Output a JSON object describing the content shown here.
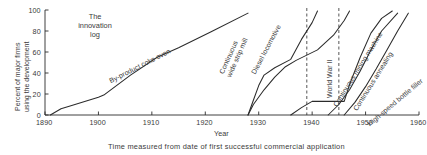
{
  "chart_data": {
    "type": "line",
    "title": "The innovation log",
    "xlabel": "Year",
    "ylabel": "Percent of major firms using the development",
    "caption": "Time measured from date of first successful commercial application",
    "xlim": [
      1890,
      1960
    ],
    "ylim": [
      0,
      100
    ],
    "grid": false,
    "legend": "none (curves labeled inline)",
    "xticks": [
      "1890",
      "1900",
      "1910",
      "1920",
      "1930",
      "1940",
      "1950",
      "1960"
    ],
    "yticks": [
      "0",
      "20",
      "40",
      "60",
      "80",
      "100"
    ],
    "annotations": [
      {
        "name": "world-war-2",
        "label": "World War II",
        "x_start": 1939,
        "x_end": 1945,
        "style": "vertical dashed band"
      }
    ],
    "series": [
      {
        "name": "By-product coke oven",
        "label": "By-product coke oven",
        "points": [
          {
            "x": 1891,
            "y": 0
          },
          {
            "x": 1893,
            "y": 6
          },
          {
            "x": 1895,
            "y": 9
          },
          {
            "x": 1900,
            "y": 17
          },
          {
            "x": 1901,
            "y": 19
          },
          {
            "x": 1906,
            "y": 38
          },
          {
            "x": 1911,
            "y": 55
          },
          {
            "x": 1915,
            "y": 64
          },
          {
            "x": 1921,
            "y": 79
          },
          {
            "x": 1928,
            "y": 97
          }
        ]
      },
      {
        "name": "Continuous wide strip mill",
        "label": "Continuous wide strip mill",
        "points": [
          {
            "x": 1928,
            "y": 0
          },
          {
            "x": 1929,
            "y": 14
          },
          {
            "x": 1930,
            "y": 28
          },
          {
            "x": 1931,
            "y": 38
          },
          {
            "x": 1933,
            "y": 45
          },
          {
            "x": 1936,
            "y": 53
          },
          {
            "x": 1938,
            "y": 72
          },
          {
            "x": 1940,
            "y": 88
          },
          {
            "x": 1941,
            "y": 99
          }
        ]
      },
      {
        "name": "Diesel locomotive",
        "label": "Diesel locomotive",
        "points": [
          {
            "x": 1928,
            "y": 0
          },
          {
            "x": 1929,
            "y": 10
          },
          {
            "x": 1931,
            "y": 24
          },
          {
            "x": 1933,
            "y": 36
          },
          {
            "x": 1935,
            "y": 46
          },
          {
            "x": 1937,
            "y": 52
          },
          {
            "x": 1939,
            "y": 57
          },
          {
            "x": 1941,
            "y": 62
          },
          {
            "x": 1944,
            "y": 76
          },
          {
            "x": 1946,
            "y": 90
          },
          {
            "x": 1947,
            "y": 99
          }
        ]
      },
      {
        "name": "Continuous mining machine",
        "label": "Continuous mining machine",
        "points": [
          {
            "x": 1936,
            "y": 0
          },
          {
            "x": 1938,
            "y": 7
          },
          {
            "x": 1940,
            "y": 13
          },
          {
            "x": 1946,
            "y": 13
          },
          {
            "x": 1947,
            "y": 29
          },
          {
            "x": 1949,
            "y": 55
          },
          {
            "x": 1951,
            "y": 78
          },
          {
            "x": 1953,
            "y": 92
          },
          {
            "x": 1955,
            "y": 99
          }
        ]
      },
      {
        "name": "Continuous annealing",
        "label": "Continuous annealing",
        "points": [
          {
            "x": 1943,
            "y": 0
          },
          {
            "x": 1945,
            "y": 10
          },
          {
            "x": 1947,
            "y": 24
          },
          {
            "x": 1949,
            "y": 42
          },
          {
            "x": 1951,
            "y": 62
          },
          {
            "x": 1953,
            "y": 80
          },
          {
            "x": 1956,
            "y": 97
          }
        ]
      },
      {
        "name": "High-speed bottle filler",
        "label": "High-speed bottle filler",
        "points": [
          {
            "x": 1946,
            "y": 0
          },
          {
            "x": 1948,
            "y": 12
          },
          {
            "x": 1950,
            "y": 27
          },
          {
            "x": 1952,
            "y": 44
          },
          {
            "x": 1954,
            "y": 62
          },
          {
            "x": 1956,
            "y": 80
          },
          {
            "x": 1958,
            "y": 97
          }
        ]
      }
    ]
  },
  "colors": {
    "ink": "#2b2b2b",
    "background": "#ffffff"
  }
}
